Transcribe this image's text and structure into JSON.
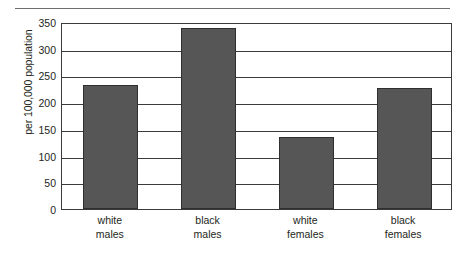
{
  "chart_data": {
    "type": "bar",
    "title": "",
    "subtitle": "",
    "xlabel": "",
    "ylabel": "per 100,000 population",
    "categories": [
      "white males",
      "black males",
      "white females",
      "black females"
    ],
    "category_lines": [
      [
        "white",
        "males"
      ],
      [
        "black",
        "males"
      ],
      [
        "white",
        "females"
      ],
      [
        "black",
        "females"
      ]
    ],
    "values": [
      232,
      338,
      135,
      227
    ],
    "ylim": [
      0,
      350
    ],
    "ytick_values": [
      0,
      50,
      100,
      150,
      200,
      250,
      300,
      350
    ],
    "ytick_labels": [
      "0",
      "50",
      "100",
      "150",
      "200",
      "250",
      "300",
      "350"
    ],
    "grid": "horizontal",
    "legend": "none",
    "bar_color": "#565656",
    "bar_border_color": "#2f2f2f",
    "axis_color": "#3b3b3b",
    "text_color": "#231f20",
    "background": "#ffffff",
    "rule_color": "#6d6e70"
  }
}
